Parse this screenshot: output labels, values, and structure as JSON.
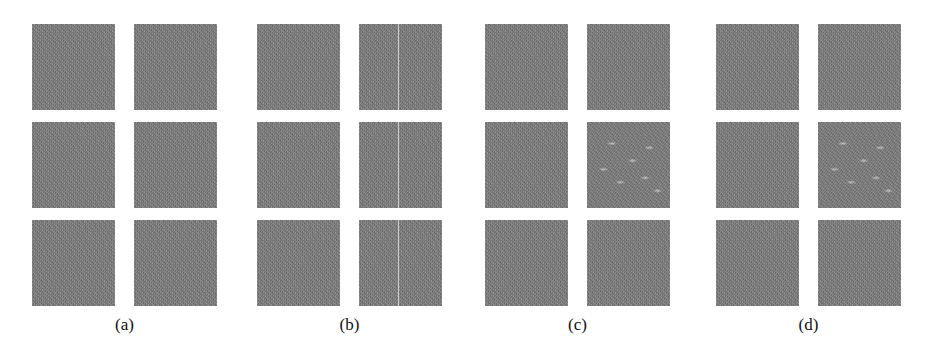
{
  "figure": {
    "panels": [
      {
        "label": "(a)",
        "x": 32,
        "tiles": [
          "plain",
          "plain",
          "plain",
          "plain",
          "plain",
          "plain"
        ]
      },
      {
        "label": "(b)",
        "x": 257,
        "tiles": [
          "plain",
          "seam",
          "plain",
          "seam",
          "plain",
          "seam"
        ]
      },
      {
        "label": "(c)",
        "x": 485,
        "tiles": [
          "plain",
          "plain",
          "plain",
          "streaks",
          "plain",
          "plain"
        ]
      },
      {
        "label": "(d)",
        "x": 716,
        "tiles": [
          "plain",
          "plain",
          "plain",
          "streaks",
          "plain",
          "plain"
        ]
      }
    ],
    "colors": {
      "tile_gray": "#7f7f7f",
      "background": "#ffffff",
      "label_text": "#111111"
    }
  }
}
